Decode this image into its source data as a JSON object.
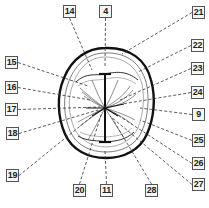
{
  "diagram": {
    "line_color": "#222222",
    "leader_style": "dashed",
    "center": [
      105,
      108
    ],
    "callouts": [
      {
        "label": "14",
        "box": [
          63,
          5
        ],
        "target": [
          92,
          70
        ]
      },
      {
        "label": "4",
        "box": [
          99,
          5
        ],
        "target": [
          105,
          68
        ]
      },
      {
        "label": "21",
        "box": [
          192,
          6
        ],
        "target": [
          122,
          54
        ]
      },
      {
        "label": "15",
        "box": [
          5,
          56
        ],
        "target": [
          88,
          86
        ]
      },
      {
        "label": "16",
        "box": [
          5,
          81
        ],
        "target": [
          90,
          100
        ]
      },
      {
        "label": "17",
        "box": [
          5,
          103
        ],
        "target": [
          100,
          107
        ]
      },
      {
        "label": "18",
        "box": [
          6,
          127
        ],
        "target": [
          98,
          110
        ]
      },
      {
        "label": "19",
        "box": [
          6,
          169
        ],
        "target": [
          100,
          110
        ]
      },
      {
        "label": "22",
        "box": [
          191,
          39
        ],
        "target": [
          138,
          72
        ]
      },
      {
        "label": "23",
        "box": [
          191,
          62
        ],
        "target": [
          120,
          100
        ]
      },
      {
        "label": "24",
        "box": [
          191,
          86
        ],
        "target": [
          122,
          104
        ]
      },
      {
        "label": "9",
        "box": [
          192,
          108
        ],
        "target": [
          140,
          108
        ]
      },
      {
        "label": "25",
        "box": [
          192,
          134
        ],
        "target": [
          140,
          120
        ]
      },
      {
        "label": "26",
        "box": [
          192,
          157
        ],
        "target": [
          113,
          112
        ]
      },
      {
        "label": "27",
        "box": [
          192,
          178
        ],
        "target": [
          110,
          116
        ]
      },
      {
        "label": "20",
        "box": [
          73,
          184
        ],
        "target": [
          102,
          112
        ]
      },
      {
        "label": "11",
        "box": [
          100,
          184
        ],
        "target": [
          105,
          150
        ]
      },
      {
        "label": "28",
        "box": [
          145,
          184
        ],
        "target": [
          112,
          118
        ]
      }
    ]
  }
}
